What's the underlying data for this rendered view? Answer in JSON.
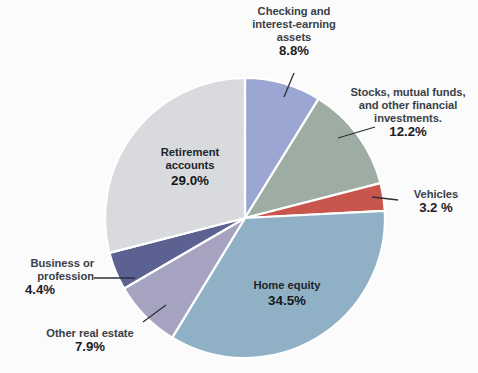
{
  "chart_data": {
    "type": "pie",
    "title": "",
    "subtitle": "",
    "xlabel": "",
    "ylabel": "",
    "legend_position": "none",
    "grid": false,
    "labels_inside": [
      "Retirement accounts",
      "Home equity"
    ],
    "categories": [
      "Checking and interest-earning assets",
      "Stocks, mutual funds, and other financial investments.",
      "Vehicles",
      "Home equity",
      "Other real estate",
      "Business or profession",
      "Retirement accounts"
    ],
    "values": [
      8.8,
      12.2,
      3.2,
      34.5,
      7.9,
      4.4,
      29.0
    ],
    "value_labels": [
      "8.8%",
      "12.2%",
      "3.2 %",
      "34.5%",
      "7.9%",
      "4.4%",
      "29.0%"
    ],
    "colors": [
      "#9ba6d2",
      "#9eada4",
      "#c8564c",
      "#8fb0c5",
      "#a6a3c0",
      "#5b6191",
      "#d8dadd"
    ],
    "slices": [
      {
        "name": "Checking and interest-earning assets",
        "label_lines": [
          "Checking and",
          "interest-earning",
          "assets"
        ],
        "value": 8.8,
        "value_label": "8.8%",
        "color": "#9ba6d2",
        "leader": true
      },
      {
        "name": "Stocks, mutual funds, and other financial investments.",
        "label_lines": [
          "Stocks, mutual funds,",
          "and other financial",
          "investments."
        ],
        "value": 12.2,
        "value_label": "12.2%",
        "color": "#9eada4",
        "leader": true
      },
      {
        "name": "Vehicles",
        "label_lines": [
          "Vehicles"
        ],
        "value": 3.2,
        "value_label": "3.2 %",
        "color": "#c8564c",
        "leader": true
      },
      {
        "name": "Home equity",
        "label_lines": [
          "Home equity"
        ],
        "value": 34.5,
        "value_label": "34.5%",
        "color": "#8fb0c5",
        "leader": false
      },
      {
        "name": "Other real estate",
        "label_lines": [
          "Other real estate"
        ],
        "value": 7.9,
        "value_label": "7.9%",
        "color": "#a6a3c0",
        "leader": true
      },
      {
        "name": "Business or profession",
        "label_lines": [
          "Business or",
          "profession"
        ],
        "value": 4.4,
        "value_label": "4.4%",
        "color": "#5b6191",
        "leader": true
      },
      {
        "name": "Retirement accounts",
        "label_lines": [
          "Retirement",
          "accounts"
        ],
        "value": 29.0,
        "value_label": "29.0%",
        "color": "#d8dadd",
        "leader": false
      }
    ]
  },
  "labels": {
    "checking": {
      "line1": "Checking and",
      "line2": "interest-earning",
      "line3": "assets",
      "pct": "8.8%"
    },
    "stocks": {
      "line1": "Stocks, mutual funds,",
      "line2": "and other financial",
      "line3": "investments.",
      "pct": "12.2%"
    },
    "vehicles": {
      "line1": "Vehicles",
      "pct": "3.2 %"
    },
    "home_equity": {
      "line1": "Home equity",
      "pct": "34.5%"
    },
    "other_real_estate": {
      "line1": "Other real estate",
      "pct": "7.9%"
    },
    "business": {
      "line1": "Business or",
      "line2": "profession",
      "pct": "4.4%"
    },
    "retirement": {
      "line1": "Retirement",
      "line2": "accounts",
      "pct": "29.0%"
    }
  },
  "artifact": {
    "text": ""
  }
}
